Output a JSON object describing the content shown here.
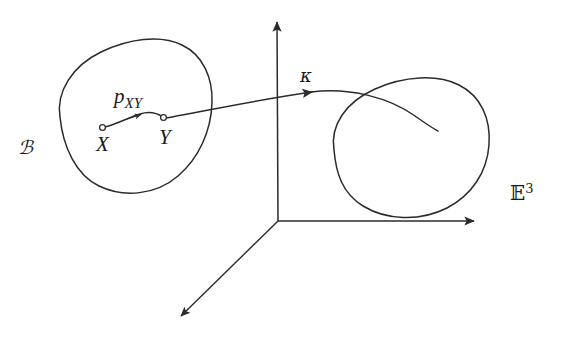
{
  "figure": {
    "background_color": "#ffffff",
    "stroke_color": "#2b2b2b",
    "width": 568,
    "height": 340
  },
  "labels": {
    "body_region": "ℬ",
    "point_x": "X",
    "point_y": "Y",
    "path_base": "p",
    "path_subscript": "XY",
    "configuration_map": "κ",
    "euclidean_space_base": "𝔼",
    "euclidean_space_superscript": "3"
  },
  "elements": {
    "left_blob_name": "reference-body-outline",
    "right_blob_name": "deformed-body-outline",
    "axes_name": "coordinate-axes",
    "kappa_curve_name": "kappa-mapping-curve",
    "path_curve_name": "path-pxy-curve"
  },
  "geometry": {
    "origin": [
      278,
      221
    ],
    "vertical_axis_tip": [
      277,
      16
    ],
    "horizontal_axis_tip": [
      481,
      221
    ],
    "diagonal_axis_tip": [
      176,
      320
    ],
    "point_x_marker": [
      102,
      127
    ],
    "point_y_marker": [
      163,
      117
    ],
    "kappa_arrow_head": [
      311,
      92
    ],
    "kappa_curve_end": [
      438,
      131
    ],
    "path_arrow_head": [
      139,
      114
    ]
  }
}
